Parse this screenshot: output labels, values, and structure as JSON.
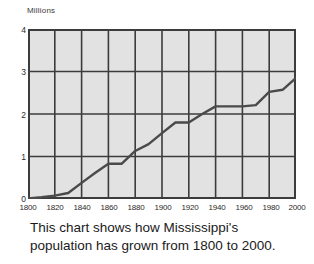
{
  "chart_data": {
    "type": "line",
    "title": "",
    "xlabel": "",
    "ylabel": "Millions",
    "unit_label": "Millions",
    "xlim": [
      1800,
      2000
    ],
    "ylim": [
      0,
      4
    ],
    "grid": true,
    "legend": "none",
    "x_ticks": [
      "1800",
      "1820",
      "1840",
      "1860",
      "1880",
      "1900",
      "1920",
      "1940",
      "1960",
      "1980",
      "2000"
    ],
    "y_ticks": [
      "0",
      "1",
      "2",
      "3",
      "4"
    ],
    "x": [
      1800,
      1810,
      1820,
      1830,
      1840,
      1850,
      1860,
      1870,
      1880,
      1890,
      1900,
      1910,
      1920,
      1930,
      1940,
      1950,
      1960,
      1970,
      1980,
      1990,
      2000
    ],
    "series": [
      {
        "name": "Mississippi population",
        "values": [
          0.01,
          0.04,
          0.08,
          0.14,
          0.38,
          0.61,
          0.83,
          0.83,
          1.13,
          1.29,
          1.55,
          1.8,
          1.8,
          2.0,
          2.18,
          2.18,
          2.18,
          2.21,
          2.52,
          2.57,
          2.85
        ]
      }
    ],
    "annotations": []
  },
  "caption": {
    "line1": "This chart shows how Mississippi's",
    "line2": "population has grown from 1800 to 2000."
  },
  "colors": {
    "plot_background": "#e2e2e2",
    "grid_line": "#3c3c3c",
    "axis_border": "#3c3c3c",
    "data_line": "#4a4a4a",
    "page_background": "#ffffff",
    "text": "#1a1a1a"
  }
}
